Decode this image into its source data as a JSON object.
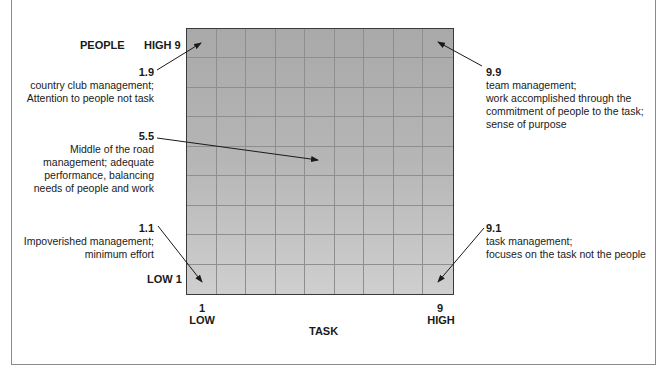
{
  "axes": {
    "y_title": "PEOPLE",
    "y_high": "HIGH 9",
    "y_low": "LOW 1",
    "x_title": "TASK",
    "x_low_num": "1",
    "x_low_word": "LOW",
    "x_high_num": "9",
    "x_high_word": "HIGH"
  },
  "grid": {
    "rows": 9,
    "cols": 9
  },
  "annotations": {
    "a19": {
      "code": "1.9",
      "line1": "country club management;",
      "line2": "Attention to people not task"
    },
    "a55": {
      "code": "5.5",
      "line1": "Middle of the road",
      "line2": "management; adequate",
      "line3": "performance, balancing",
      "line4": "needs of people and work"
    },
    "a11": {
      "code": "1.1",
      "line1": "Impoverished management;",
      "line2": "minimum effort"
    },
    "a99": {
      "code": "9.9",
      "line1": "team management;",
      "line2": "work accomplished through the",
      "line3": "commitment of people to the task;",
      "line4": "sense of purpose"
    },
    "a91": {
      "code": "9.1",
      "line1": "task management;",
      "line2": "focuses on the task not the people"
    }
  }
}
